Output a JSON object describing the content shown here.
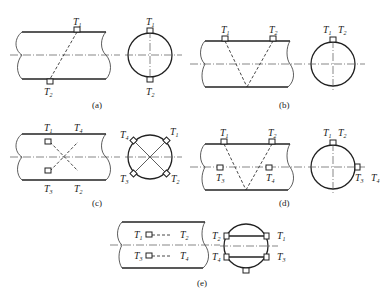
{
  "figure": {
    "panels": [
      {
        "id": "a",
        "caption": "(a)",
        "labels": {
          "side_t1": "T",
          "side_t1_sub": "1",
          "side_t2": "T",
          "side_t2_sub": "2",
          "sec_t1": "T",
          "sec_t1_sub": "1",
          "sec_t2": "T",
          "sec_t2_sub": "2"
        }
      },
      {
        "id": "b",
        "caption": "(b)",
        "labels": {
          "side_t1": "T",
          "side_t1_sub": "1",
          "side_t2": "T",
          "side_t2_sub": "2",
          "sec_t1": "T",
          "sec_t1_sub": "1",
          "sec_t2": "T",
          "sec_t2_sub": "2"
        }
      },
      {
        "id": "c",
        "caption": "(c)",
        "labels": {
          "side_t1": "T",
          "side_t1_sub": "1",
          "side_t4": "T",
          "side_t4_sub": "4",
          "side_t3": "T",
          "side_t3_sub": "3",
          "side_t2": "T",
          "side_t2_sub": "2",
          "sec_t4": "T",
          "sec_t4_sub": "4",
          "sec_t1": "T",
          "sec_t1_sub": "1",
          "sec_t3": "T",
          "sec_t3_sub": "3",
          "sec_t2": "T",
          "sec_t2_sub": "2"
        }
      },
      {
        "id": "d",
        "caption": "(d)",
        "labels": {
          "side_t1": "T",
          "side_t1_sub": "1",
          "side_t2": "T",
          "side_t2_sub": "2",
          "side_t3": "T",
          "side_t3_sub": "3",
          "side_t4": "T",
          "side_t4_sub": "4",
          "sec_t1": "T",
          "sec_t1_sub": "1",
          "sec_t2": "T",
          "sec_t2_sub": "2",
          "sec_t3": "T",
          "sec_t3_sub": "3",
          "sec_t4": "T",
          "sec_t4_sub": "4"
        }
      },
      {
        "id": "e",
        "caption": "(e)",
        "labels": {
          "side_t1": "T",
          "side_t1_sub": "1",
          "side_t2": "T",
          "side_t2_sub": "2",
          "side_t3": "T",
          "side_t3_sub": "3",
          "side_t4": "T",
          "side_t4_sub": "4",
          "sec_t2": "T",
          "sec_t2_sub": "2",
          "sec_t1": "T",
          "sec_t1_sub": "1",
          "sec_t4": "T",
          "sec_t4_sub": "4",
          "sec_t3": "T",
          "sec_t3_sub": "3"
        }
      }
    ]
  }
}
